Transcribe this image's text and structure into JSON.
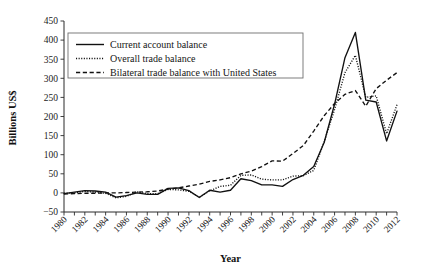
{
  "chart_data": {
    "type": "line",
    "title": "",
    "xlabel": "Year",
    "ylabel": "Billions US$",
    "xlim": [
      1980,
      2012
    ],
    "ylim": [
      -50,
      450
    ],
    "ytick_step": 50,
    "xtick_step": 1,
    "xtick_label_step": 2,
    "grid": false,
    "legend_position": "upper-left-inside",
    "x": [
      1980,
      1981,
      1982,
      1983,
      1984,
      1985,
      1986,
      1987,
      1988,
      1989,
      1990,
      1991,
      1992,
      1993,
      1994,
      1995,
      1996,
      1997,
      1998,
      1999,
      2000,
      2001,
      2002,
      2003,
      2004,
      2005,
      2006,
      2007,
      2008,
      2009,
      2010,
      2011,
      2012
    ],
    "series": [
      {
        "name": "Current account balance",
        "style": "solid",
        "values": [
          -2,
          2,
          6,
          5,
          2,
          -11,
          -7,
          0,
          -4,
          -4,
          12,
          13,
          6,
          -12,
          7,
          2,
          7,
          37,
          32,
          21,
          21,
          17,
          35,
          46,
          69,
          132,
          232,
          354,
          420,
          243,
          238,
          136,
          214
        ]
      },
      {
        "name": "Overall trade balance",
        "style": "dotted",
        "values": [
          -1,
          0,
          4,
          2,
          -1,
          -13,
          -9,
          3,
          -2,
          -2,
          9,
          8,
          4,
          -11,
          5,
          17,
          20,
          46,
          47,
          36,
          34,
          34,
          44,
          45,
          59,
          134,
          218,
          315,
          360,
          250,
          254,
          155,
          231
        ]
      },
      {
        "name": "Bilateral trade balance with United States",
        "style": "dashed",
        "values": [
          -3,
          -2,
          -1,
          -1,
          0,
          0,
          1,
          2,
          3,
          5,
          10,
          13,
          18,
          23,
          30,
          34,
          40,
          50,
          57,
          69,
          84,
          83,
          103,
          124,
          162,
          202,
          234,
          258,
          268,
          227,
          273,
          295,
          315
        ]
      }
    ],
    "ytick_labels": [
      "450",
      "400",
      "350",
      "300",
      "250",
      "200",
      "150",
      "100",
      "50",
      "0",
      "−50"
    ],
    "xtick_labels": [
      "1980",
      "1982",
      "1984",
      "1986",
      "1988",
      "1990",
      "1992",
      "1994",
      "1996",
      "1998",
      "2000",
      "2002",
      "2004",
      "2006",
      "2008",
      "2010",
      "2012"
    ]
  },
  "legend": {
    "items": [
      {
        "label": "Current account balance",
        "style": "solid"
      },
      {
        "label": "Overall trade balance",
        "style": "dotted"
      },
      {
        "label": "Bilateral trade balance with United States",
        "style": "dashed"
      }
    ]
  },
  "colors": {
    "ink": "#111111",
    "axis": "#2b2b2b",
    "legend_border": "#6f6f6f",
    "background": "#ffffff"
  }
}
